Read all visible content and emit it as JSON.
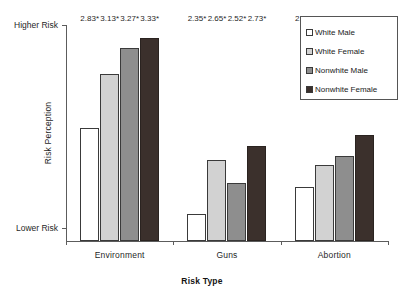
{
  "chart_data": {
    "type": "bar",
    "title": "",
    "xlabel": "Risk Type",
    "ylabel": "Risk Perception",
    "categories": [
      "Environment",
      "Guns",
      "Abortion"
    ],
    "series": [
      {
        "name": "White Male",
        "swatch": "#ffffff",
        "values": [
          2.83,
          2.35,
          2.5
        ],
        "labels": [
          "2.83*",
          "2.35*",
          "2.50*"
        ]
      },
      {
        "name": "White Female",
        "swatch": "#d2d2d2",
        "values": [
          3.13,
          2.65,
          2.62
        ],
        "labels": [
          "3.13*",
          "2.65*",
          "2.62"
        ]
      },
      {
        "name": "Nonwhite Male",
        "swatch": "#8e8e8e",
        "values": [
          3.27,
          2.52,
          2.67
        ],
        "labels": [
          "3.27*",
          "2.52*",
          "2.67"
        ]
      },
      {
        "name": "Nonwhite Female",
        "swatch": "#3b302c",
        "values": [
          3.33,
          2.73,
          2.79
        ],
        "labels": [
          "3.33*",
          "2.73*",
          "2.79*"
        ]
      }
    ],
    "ylim": [
      2.2,
      3.4
    ],
    "ytick_labels": [
      "Higher Risk",
      "Lower Risk"
    ],
    "ytick_values": [
      3.4,
      2.27
    ],
    "grid": false,
    "legend_position": "top-right"
  },
  "axes": {
    "y_title": "Risk Perception",
    "x_title": "Risk Type",
    "y_high_label": "Higher Risk",
    "y_low_label": "Lower Risk"
  },
  "legend": {
    "items": [
      {
        "label": "White Male",
        "color": "#ffffff"
      },
      {
        "label": "White Female",
        "color": "#d2d2d2"
      },
      {
        "label": "Nonwhite Male",
        "color": "#8e8e8e"
      },
      {
        "label": "Nonwhite Female",
        "color": "#3b302c"
      }
    ]
  },
  "categories": {
    "items": [
      "Environment",
      "Guns",
      "Abortion"
    ]
  }
}
